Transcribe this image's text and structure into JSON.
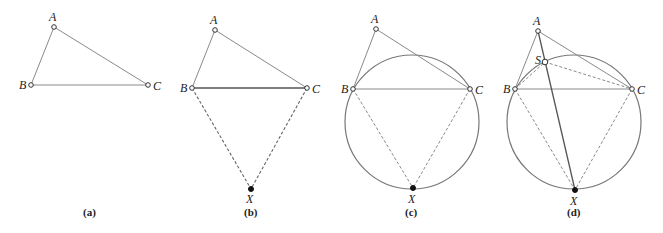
{
  "figure": {
    "panels": [
      {
        "id": "a",
        "caption": "(a)",
        "points": {
          "A": {
            "label": "A",
            "x": 54,
            "y": 27
          },
          "B": {
            "label": "B",
            "x": 31,
            "y": 85
          },
          "C": {
            "label": "C",
            "x": 148,
            "y": 85
          }
        }
      },
      {
        "id": "b",
        "caption": "(b)",
        "points": {
          "A": {
            "label": "A",
            "x": 215,
            "y": 30
          },
          "B": {
            "label": "B",
            "x": 192,
            "y": 88
          },
          "C": {
            "label": "C",
            "x": 307,
            "y": 88
          },
          "X": {
            "label": "X",
            "x": 251,
            "y": 189
          }
        }
      },
      {
        "id": "c",
        "caption": "(c)",
        "points": {
          "A": {
            "label": "A",
            "x": 376,
            "y": 29
          },
          "B": {
            "label": "B",
            "x": 353,
            "y": 89
          },
          "C": {
            "label": "C",
            "x": 470,
            "y": 89
          },
          "X": {
            "label": "X",
            "x": 413,
            "y": 188
          }
        },
        "circle": {
          "cx": 412,
          "cy": 122,
          "r": 67
        }
      },
      {
        "id": "d",
        "caption": "(d)",
        "points": {
          "A": {
            "label": "A",
            "x": 538,
            "y": 31
          },
          "S": {
            "label": "S",
            "x": 545,
            "y": 62
          },
          "B": {
            "label": "B",
            "x": 515,
            "y": 89
          },
          "C": {
            "label": "C",
            "x": 632,
            "y": 89
          },
          "X": {
            "label": "X",
            "x": 575,
            "y": 190
          }
        },
        "circle": {
          "cx": 574,
          "cy": 122,
          "r": 67
        }
      }
    ]
  }
}
